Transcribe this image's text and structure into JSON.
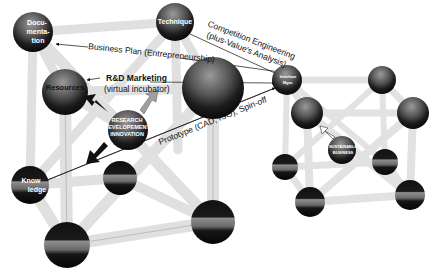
{
  "diagram": {
    "left_structure": {
      "nodes": {
        "documentation": "Docu-",
        "documentation_2": "menta-",
        "documentation_3": "tion",
        "technique": "Technique",
        "resources": "Resources",
        "knowledge": "Know",
        "knowledge_2": "ledge",
        "center_1": "RESEARCH",
        "center_2": "DEVELOPEMENT",
        "center_3": "INNOVATION"
      }
    },
    "right_structure": {
      "nodes": {
        "interface_1": "Interface",
        "interface_2": "Mgm.",
        "center_1": "SUSTAINABLE",
        "center_2": "BUSINESS"
      }
    },
    "annotations": {
      "business_plan": "Business Plan (Entrepreneurship)",
      "rd_marketing_1": "R&D Marketing",
      "rd_marketing_2": "(virtual incubator)",
      "competition_1": "Competition Engineering",
      "competition_2": "(plus-Value's Analysis)",
      "prototype": "Prototype (CAD, ISO), Spin-off"
    },
    "colors": {
      "background": "#ffffff",
      "rod": "#e4e4e4",
      "sphere_dark": "#1a1a1a",
      "sphere_light": "#8a8a8a",
      "text": "#111111"
    }
  }
}
